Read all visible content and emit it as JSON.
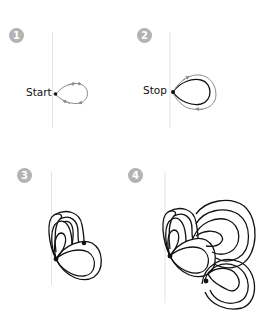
{
  "steps": [
    {
      "number": "1",
      "label": "Start"
    },
    {
      "number": "2",
      "label": "Stop"
    },
    {
      "number": "3",
      "label": ""
    },
    {
      "number": "4",
      "label": ""
    }
  ],
  "colors": {
    "badge": "#b3b3b3",
    "guide_line": "#e3e3e3",
    "stroke": "#111111",
    "arrow": "#8c8c8c"
  }
}
